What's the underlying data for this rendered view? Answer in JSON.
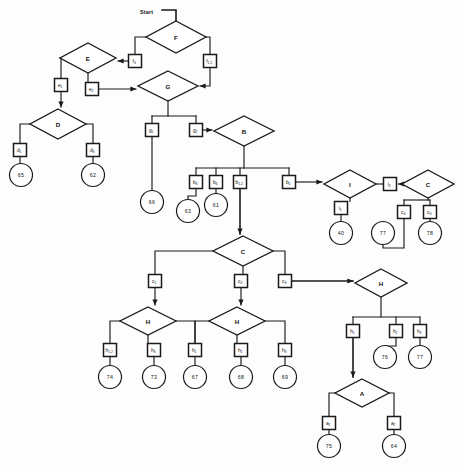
{
  "diagram": {
    "title_label": "Start",
    "type": "flowchart",
    "stroke_color": "#1a1a1a",
    "fill_color": "#ffffff",
    "background_color": "#fdfdfd",
    "decisions": [
      {
        "id": "F",
        "label": "F",
        "x": 176,
        "y": 37,
        "rx": 30,
        "ry": 16
      },
      {
        "id": "E",
        "label": "E",
        "x": 88,
        "y": 58,
        "rx": 28,
        "ry": 15
      },
      {
        "id": "G",
        "label": "G",
        "x": 168,
        "y": 86,
        "rx": 30,
        "ry": 15
      },
      {
        "id": "D",
        "label": "D",
        "x": 58,
        "y": 124,
        "rx": 28,
        "ry": 15
      },
      {
        "id": "B",
        "label": "B",
        "x": 244,
        "y": 131,
        "rx": 30,
        "ry": 15
      },
      {
        "id": "I",
        "label": "I",
        "x": 350,
        "y": 184,
        "rx": 26,
        "ry": 14
      },
      {
        "id": "C2",
        "label": "C",
        "x": 428,
        "y": 184,
        "rx": 26,
        "ry": 14
      },
      {
        "id": "C1",
        "label": "C",
        "x": 243,
        "y": 251,
        "rx": 30,
        "ry": 15
      },
      {
        "id": "H1",
        "label": "H",
        "x": 148,
        "y": 321,
        "rx": 28,
        "ry": 14
      },
      {
        "id": "H2",
        "label": "H",
        "x": 237,
        "y": 321,
        "rx": 28,
        "ry": 14
      },
      {
        "id": "H3",
        "label": "H",
        "x": 381,
        "y": 283,
        "rx": 26,
        "ry": 14
      },
      {
        "id": "A",
        "label": "A",
        "x": 362,
        "y": 393,
        "rx": 27,
        "ry": 14
      }
    ],
    "boxes": [
      {
        "id": "f3",
        "base": "f",
        "sub": "3",
        "x": 135,
        "y": 61
      },
      {
        "id": "f12",
        "base": "f",
        "sub": "1,2",
        "x": 210,
        "y": 61
      },
      {
        "id": "e1",
        "base": "e",
        "sub": "1",
        "x": 61,
        "y": 85
      },
      {
        "id": "e2",
        "base": "e",
        "sub": "2",
        "x": 92,
        "y": 89
      },
      {
        "id": "d1",
        "base": "d",
        "sub": "1",
        "x": 20,
        "y": 150
      },
      {
        "id": "d3",
        "base": "d",
        "sub": "3",
        "x": 93,
        "y": 150
      },
      {
        "id": "g1",
        "base": "g",
        "sub": "1",
        "x": 152,
        "y": 130
      },
      {
        "id": "g2",
        "base": "g",
        "sub": "2",
        "x": 196,
        "y": 130
      },
      {
        "id": "b3",
        "base": "b",
        "sub": "3",
        "x": 196,
        "y": 182
      },
      {
        "id": "b4",
        "base": "b",
        "sub": "4",
        "x": 216,
        "y": 182
      },
      {
        "id": "b12",
        "base": "b",
        "sub": "1,2",
        "x": 240,
        "y": 182
      },
      {
        "id": "b5",
        "base": "b",
        "sub": "5",
        "x": 289,
        "y": 182
      },
      {
        "id": "i1",
        "base": "i",
        "sub": "1",
        "x": 341,
        "y": 208
      },
      {
        "id": "i2",
        "base": "i",
        "sub": "2",
        "x": 390,
        "y": 184
      },
      {
        "id": "c4",
        "base": "c",
        "sub": "4",
        "x": 404,
        "y": 212
      },
      {
        "id": "c3r",
        "base": "c",
        "sub": "3",
        "x": 430,
        "y": 212
      },
      {
        "id": "c1",
        "base": "c",
        "sub": "1",
        "x": 155,
        "y": 281
      },
      {
        "id": "c2",
        "base": "c",
        "sub": "2",
        "x": 241,
        "y": 281
      },
      {
        "id": "c3",
        "base": "c",
        "sub": "3",
        "x": 285,
        "y": 281
      },
      {
        "id": "h12",
        "base": "h",
        "sub": "1,2",
        "x": 110,
        "y": 350
      },
      {
        "id": "h3a",
        "base": "h",
        "sub": "3",
        "x": 154,
        "y": 350
      },
      {
        "id": "h1b",
        "base": "h",
        "sub": "1",
        "x": 195,
        "y": 350
      },
      {
        "id": "h2b",
        "base": "h",
        "sub": "2",
        "x": 241,
        "y": 350
      },
      {
        "id": "h3b",
        "base": "h",
        "sub": "3",
        "x": 285,
        "y": 350
      },
      {
        "id": "h1c",
        "base": "h",
        "sub": "1",
        "x": 353,
        "y": 331
      },
      {
        "id": "h2c",
        "base": "h",
        "sub": "2",
        "x": 396,
        "y": 331
      },
      {
        "id": "h3c",
        "base": "h",
        "sub": "3",
        "x": 420,
        "y": 331
      },
      {
        "id": "a1",
        "base": "a",
        "sub": "1",
        "x": 329,
        "y": 423
      },
      {
        "id": "a2",
        "base": "a",
        "sub": "2",
        "x": 394,
        "y": 423
      }
    ],
    "terminals": [
      {
        "id": "t65",
        "value": "65",
        "x": 21,
        "y": 175
      },
      {
        "id": "t62",
        "value": "62",
        "x": 93,
        "y": 175
      },
      {
        "id": "t66",
        "value": "66",
        "x": 152,
        "y": 202
      },
      {
        "id": "t63",
        "value": "63",
        "x": 188,
        "y": 211
      },
      {
        "id": "t61",
        "value": "61",
        "x": 216,
        "y": 205
      },
      {
        "id": "t40",
        "value": "40",
        "x": 341,
        "y": 233
      },
      {
        "id": "t77",
        "value": "77",
        "x": 383,
        "y": 233
      },
      {
        "id": "t78",
        "value": "78",
        "x": 430,
        "y": 233
      },
      {
        "id": "t74",
        "value": "74",
        "x": 110,
        "y": 377
      },
      {
        "id": "t73",
        "value": "73",
        "x": 154,
        "y": 377
      },
      {
        "id": "t67",
        "value": "67",
        "x": 195,
        "y": 377
      },
      {
        "id": "t68",
        "value": "68",
        "x": 241,
        "y": 377
      },
      {
        "id": "t69",
        "value": "69",
        "x": 285,
        "y": 377
      },
      {
        "id": "t76",
        "value": "76",
        "x": 385,
        "y": 357
      },
      {
        "id": "t77b",
        "value": "77",
        "x": 420,
        "y": 357
      },
      {
        "id": "t75",
        "value": "75",
        "x": 329,
        "y": 446
      },
      {
        "id": "t64",
        "value": "64",
        "x": 394,
        "y": 446
      }
    ]
  }
}
